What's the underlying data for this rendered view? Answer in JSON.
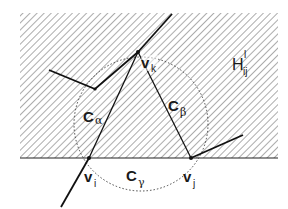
{
  "diagram": {
    "type": "geometric-construction",
    "region": {
      "label_main": "H",
      "label_sup": "l",
      "label_sub": "ij",
      "fill": "hatched",
      "bounds": {
        "x": 20,
        "y": 13,
        "width": 258,
        "height": 145
      },
      "hatch_color": "#555555"
    },
    "vertices": [
      {
        "id": "vk",
        "main": "v",
        "sub": "k",
        "x": 138,
        "y": 52
      },
      {
        "id": "vi",
        "main": "v",
        "sub": "i",
        "x": 89,
        "y": 158
      },
      {
        "id": "vj",
        "main": "v",
        "sub": "j",
        "x": 191,
        "y": 158
      }
    ],
    "edge_labels": [
      {
        "id": "c-alpha",
        "main": "C",
        "sub": "α"
      },
      {
        "id": "c-beta",
        "main": "C",
        "sub": "β"
      },
      {
        "id": "c-gamma",
        "main": "C",
        "sub": "γ"
      }
    ],
    "circle": {
      "cx": 141,
      "cy": 124,
      "r": 67,
      "style": "dotted"
    },
    "line_color": "#111111"
  }
}
